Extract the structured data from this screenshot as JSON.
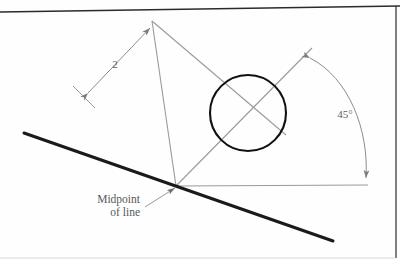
{
  "figure": {
    "background_color": "#fefefe",
    "border_color": "#2b2b2b",
    "construction_line_color": "#9a9a9a",
    "heavy_line_color": "#1a1a1a",
    "circle_color": "#111111",
    "text_color": "#585858"
  },
  "labels": {
    "dimension_2": "2",
    "angle_45": "45°",
    "midpoint_line1": "Midpoint",
    "midpoint_line2": "of line"
  },
  "geometry": {
    "vertex": {
      "x": 176,
      "y": 186
    },
    "square_top_corner": {
      "x": 152,
      "y": 21
    },
    "square_right_corner": {
      "x": 312,
      "y": 48
    },
    "circle": {
      "cx": 248,
      "cy": 113,
      "r": 38
    },
    "heavy_line_start": {
      "x": 24,
      "y": 133
    },
    "heavy_line_end": {
      "x": 333,
      "y": 241
    },
    "horizontal_ref_end": {
      "x": 368,
      "y": 186
    },
    "dimension_arrow_start": {
      "x": 88,
      "y": 93
    },
    "dimension_arrow_end": {
      "x": 150,
      "y": 28
    },
    "angle_arc_start": {
      "x": 310,
      "y": 58
    },
    "angle_arc_end": {
      "x": 366,
      "y": 184
    },
    "angle_value_degrees": 45,
    "dimension_value": 2
  }
}
